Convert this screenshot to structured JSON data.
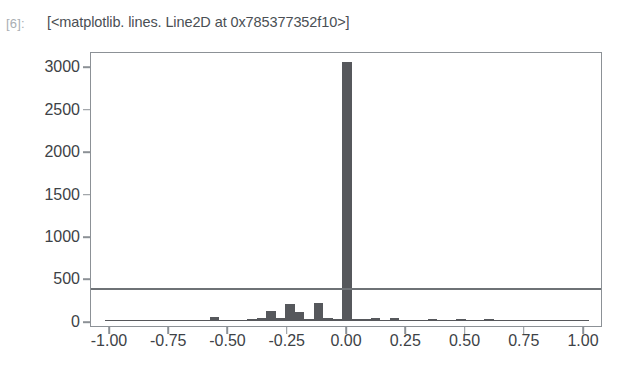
{
  "notebook": {
    "prompt_label": "[6]:",
    "output_text": "[<matplotlib. lines. Line2D at 0x785377352f10>]"
  },
  "chart_data": {
    "type": "bar",
    "title": "",
    "xlabel": "",
    "ylabel": "",
    "xlim": [
      -1.08,
      1.08
    ],
    "ylim": [
      -60,
      3180
    ],
    "grid": false,
    "legend": null,
    "bar_color": "#56585c",
    "frame_color": "#8c9196",
    "xticks": [
      "-1.00",
      "-0.75",
      "-0.50",
      "-0.25",
      "0.00",
      "0.25",
      "0.50",
      "0.75",
      "1.00"
    ],
    "xtick_values": [
      -1.0,
      -0.75,
      -0.5,
      -0.25,
      0.0,
      0.25,
      0.5,
      0.75,
      1.0
    ],
    "yticks": [
      "0",
      "500",
      "1000",
      "1500",
      "2000",
      "2500",
      "3000"
    ],
    "ytick_values": [
      0,
      500,
      1000,
      1500,
      2000,
      2500,
      3000
    ],
    "annotations": [
      {
        "name": "threshold-line",
        "type": "hline",
        "y": 410,
        "color": "#6e7276"
      }
    ],
    "bar_width": 0.04,
    "x": [
      -1.0,
      -0.96,
      -0.92,
      -0.88,
      -0.84,
      -0.8,
      -0.76,
      -0.72,
      -0.68,
      -0.64,
      -0.6,
      -0.56,
      -0.52,
      -0.48,
      -0.44,
      -0.4,
      -0.36,
      -0.32,
      -0.28,
      -0.24,
      -0.2,
      -0.16,
      -0.12,
      -0.08,
      -0.04,
      0.0,
      0.04,
      0.08,
      0.12,
      0.16,
      0.2,
      0.24,
      0.28,
      0.32,
      0.36,
      0.4,
      0.44,
      0.48,
      0.52,
      0.56,
      0.6,
      0.64,
      0.68,
      0.72,
      0.76,
      0.8,
      0.84,
      0.88,
      0.92,
      0.96,
      1.0
    ],
    "values": [
      4,
      3,
      2,
      14,
      4,
      3,
      6,
      3,
      4,
      5,
      8,
      48,
      10,
      9,
      16,
      28,
      32,
      118,
      30,
      196,
      110,
      28,
      215,
      40,
      22,
      3050,
      25,
      18,
      30,
      14,
      32,
      10,
      9,
      12,
      26,
      10,
      8,
      18,
      14,
      6,
      20,
      8,
      6,
      10,
      5,
      12,
      4,
      6,
      3,
      5,
      4
    ]
  }
}
